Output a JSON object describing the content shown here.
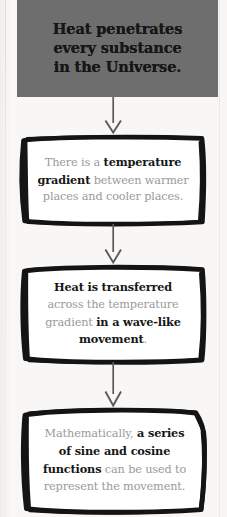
{
  "page": {
    "background_color": "#f8f7f5"
  },
  "banner": {
    "fill_color": "#6e6e6e",
    "text_color": "#171717",
    "line1": "Heat penetrates",
    "line2": "every substance",
    "line3": "in the Universe."
  },
  "steps": [
    {
      "id": "step-1",
      "border_style": "hand-drawn",
      "text_color": "#9a9a9a",
      "emphasis_color": "#161616",
      "segments": [
        {
          "text": "There is a ",
          "bold": false
        },
        {
          "text": "temperature gradient",
          "bold": true
        },
        {
          "text": " between warmer places and cooler places.",
          "bold": false
        }
      ],
      "plain_text": "There is a temperature gradient between warmer places and cooler places."
    },
    {
      "id": "step-2",
      "border_style": "hand-drawn",
      "text_color": "#9a9a9a",
      "emphasis_color": "#161616",
      "segments": [
        {
          "text": "Heat is transferred",
          "bold": true
        },
        {
          "text": " across the temperature gradient ",
          "bold": false
        },
        {
          "text": "in a wave-like movement",
          "bold": true
        },
        {
          "text": ".",
          "bold": false
        }
      ],
      "plain_text": "Heat is transferred across the temperature gradient in a wave-like movement."
    },
    {
      "id": "step-3",
      "border_style": "hand-drawn",
      "text_color": "#9a9a9a",
      "emphasis_color": "#161616",
      "segments": [
        {
          "text": "Mathematically, ",
          "bold": false
        },
        {
          "text": "a series of sine and cosine functions",
          "bold": true
        },
        {
          "text": " can be used to represent the movement.",
          "bold": false
        }
      ],
      "plain_text": "Mathematically, a series of sine and cosine functions can be used to represent the movement."
    }
  ],
  "connectors": [
    {
      "id": "connector-1",
      "icon": "arrow-down-icon",
      "color": "#5a5a5a"
    },
    {
      "id": "connector-2",
      "icon": "arrow-down-icon",
      "color": "#5a5a5a"
    },
    {
      "id": "connector-3",
      "icon": "arrow-down-icon",
      "color": "#5a5a5a"
    }
  ]
}
